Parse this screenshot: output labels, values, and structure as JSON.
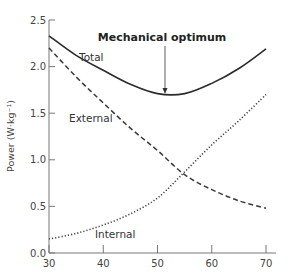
{
  "chart_data": {
    "type": "line",
    "title": "",
    "xlabel": "",
    "ylabel": "Power (W·kg⁻¹)",
    "xlim": [
      30,
      70
    ],
    "ylim": [
      0,
      2.5
    ],
    "grid": false,
    "legend": "inline labels",
    "x_ticks": [
      "30",
      "40",
      "50",
      "60",
      "70"
    ],
    "y_ticks": [
      "0.0",
      "0.5",
      "1.0",
      "1.5",
      "2.0",
      "2.5"
    ],
    "x": [
      30,
      35,
      40,
      45,
      50,
      55,
      60,
      65,
      70
    ],
    "series": [
      {
        "name": "Total",
        "style": "solid",
        "values": [
          2.33,
          2.12,
          1.96,
          1.81,
          1.71,
          1.71,
          1.82,
          1.98,
          2.19
        ]
      },
      {
        "name": "External",
        "style": "dashed",
        "values": [
          2.2,
          1.89,
          1.61,
          1.34,
          1.1,
          0.84,
          0.68,
          0.56,
          0.48
        ]
      },
      {
        "name": "Internal",
        "style": "dotted",
        "values": [
          0.15,
          0.21,
          0.3,
          0.42,
          0.59,
          0.87,
          1.16,
          1.42,
          1.7
        ]
      }
    ],
    "annotations": [
      {
        "text": "Mechanical optimum",
        "x": 51.4,
        "y": 1.7,
        "arrow": true
      }
    ]
  },
  "labels": {
    "ylabel": "Power (W·kg⁻¹)",
    "total": "Total",
    "external": "External",
    "internal": "Internal",
    "annotation": "Mechanical optimum"
  }
}
